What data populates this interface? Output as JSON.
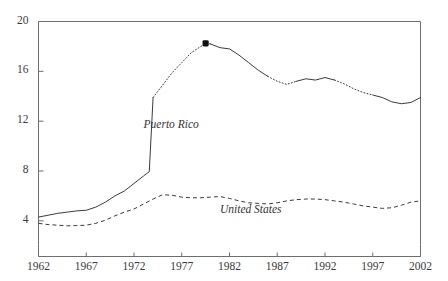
{
  "chart_data": {
    "type": "line",
    "title": "",
    "subtitle": "",
    "xlabel": "",
    "ylabel": "",
    "xlim": [
      1962,
      2002
    ],
    "ylim": [
      2.1,
      20
    ],
    "grid": false,
    "legend_position": "inline-annotations",
    "x_ticks": [
      "1962",
      "1967",
      "1972",
      "1977",
      "1982",
      "1987",
      "1992",
      "1997",
      "2002"
    ],
    "x_tick_values": [
      1962,
      1967,
      1972,
      1977,
      1982,
      1987,
      1992,
      1997,
      2002
    ],
    "y_ticks": [
      "4",
      "8",
      "12",
      "16",
      "20"
    ],
    "y_tick_values": [
      4,
      8,
      12,
      16,
      20
    ],
    "annotations": [
      {
        "text": "Puerto Rico",
        "x": 1973.0,
        "y": 11.6
      },
      {
        "text": "United States",
        "x": 1981.0,
        "y": 4.75
      }
    ],
    "markers": [
      {
        "series": "Puerto Rico",
        "x": 1979.5,
        "y": 18.25,
        "style": "filled-square"
      }
    ],
    "series": [
      {
        "name": "Puerto Rico",
        "line_style": "solid-and-dotted",
        "color": "#333333",
        "x": [
          1962,
          1963,
          1964,
          1965,
          1966,
          1967,
          1968,
          1969,
          1970,
          1971,
          1972,
          1973,
          1973.6,
          1974,
          1975,
          1976,
          1977,
          1978,
          1979,
          1979.5,
          1980,
          1981,
          1982,
          1983,
          1984,
          1985,
          1986,
          1987,
          1988,
          1989,
          1990,
          1991,
          1992,
          1993,
          1994,
          1995,
          1996,
          1997,
          1998,
          1999,
          2000,
          2001,
          2002
        ],
        "y": [
          4.3,
          4.45,
          4.6,
          4.7,
          4.8,
          4.85,
          5.1,
          5.5,
          6.0,
          6.4,
          7.0,
          7.6,
          7.95,
          13.9,
          14.9,
          15.9,
          16.7,
          17.5,
          18.0,
          18.25,
          18.2,
          17.9,
          17.8,
          17.3,
          16.7,
          16.1,
          15.6,
          15.2,
          14.95,
          15.2,
          15.4,
          15.3,
          15.5,
          15.3,
          15.0,
          14.6,
          14.3,
          14.1,
          13.9,
          13.55,
          13.4,
          13.5,
          13.9
        ]
      },
      {
        "name": "United States",
        "line_style": "dashed",
        "color": "#333333",
        "x": [
          1962,
          1963,
          1964,
          1965,
          1966,
          1967,
          1968,
          1969,
          1970,
          1971,
          1972,
          1973,
          1974,
          1975,
          1976,
          1977,
          1978,
          1979,
          1980,
          1981,
          1982,
          1983,
          1984,
          1985,
          1986,
          1987,
          1988,
          1989,
          1990,
          1991,
          1992,
          1993,
          1994,
          1995,
          1996,
          1997,
          1998,
          1999,
          2000,
          2001,
          2002
        ],
        "y": [
          3.8,
          3.7,
          3.65,
          3.6,
          3.62,
          3.65,
          3.8,
          4.05,
          4.4,
          4.7,
          4.95,
          5.35,
          5.75,
          6.1,
          6.05,
          5.9,
          5.85,
          5.85,
          5.9,
          5.95,
          5.8,
          5.6,
          5.45,
          5.4,
          5.35,
          5.45,
          5.6,
          5.7,
          5.75,
          5.75,
          5.7,
          5.6,
          5.5,
          5.35,
          5.2,
          5.1,
          5.0,
          5.05,
          5.25,
          5.5,
          5.6
        ]
      }
    ]
  }
}
